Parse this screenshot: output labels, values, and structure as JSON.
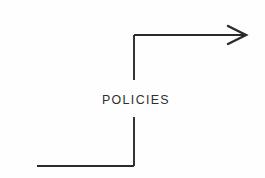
{
  "diagram": {
    "background_color": "#fefefe",
    "line_color": "#2a2a2c",
    "text_color": "#2e2e30",
    "label": "POLICIES",
    "segments": {
      "lower_horizontal": "M 37 166 L 134 166",
      "lower_vertical": "M 134 166 L 134 117",
      "upper_vertical": "M 134 80 L 134 35",
      "upper_horizontal": "M 134 35 L 245 35",
      "arrow_head": "M 228 26 L 246 35 L 228 44"
    },
    "geometry": {
      "width": 265,
      "height": 178,
      "label_x": 102,
      "label_baseline_y": 104,
      "gap_top_y": 80,
      "gap_bottom_y": 117
    }
  }
}
